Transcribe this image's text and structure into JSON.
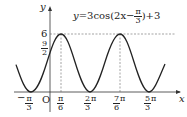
{
  "diagram": {
    "equation": "y=3cos(2x−π/3)+3",
    "equation_parts": {
      "lhs": "y",
      "eq": "=3cos",
      "open": "(2x−",
      "num": "π",
      "den": "3",
      "close": ")+3"
    },
    "axes": {
      "x_label": "x",
      "y_label": "y",
      "origin_label": "O"
    },
    "y_ticks": [
      {
        "label": "6"
      },
      {
        "num": "9",
        "den": "2"
      }
    ],
    "x_ticks": [
      {
        "sign": "−",
        "num": "π",
        "den": "3",
        "suffix": ""
      },
      {
        "sign": "",
        "num": "π",
        "den": "6",
        "suffix": ""
      },
      {
        "sign": "",
        "num": "2",
        "den": "3",
        "suffix": "π"
      },
      {
        "sign": "",
        "num": "7",
        "den": "6",
        "suffix": "π"
      },
      {
        "sign": "",
        "num": "5",
        "den": "3",
        "suffix": "π"
      }
    ],
    "colors": {
      "curve": "#222222",
      "axis": "#333333",
      "dashed": "#666666"
    }
  }
}
